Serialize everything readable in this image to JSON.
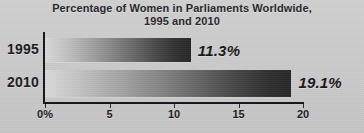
{
  "chart_data": {
    "type": "bar",
    "orientation": "horizontal",
    "title": "Percentage of Women in Parliaments Worldwide, 1995 and 2010",
    "title_lines": [
      "Percentage of Women in Parliaments Worldwide,",
      "1995 and 2010"
    ],
    "categories": [
      "1995",
      "2010"
    ],
    "values": [
      11.3,
      19.1
    ],
    "value_labels": [
      "11.3%",
      "19.1%"
    ],
    "xlabel": "",
    "ylabel": "",
    "xlim": [
      0,
      20
    ],
    "xticks": [
      0,
      5,
      10,
      15,
      20
    ],
    "xtick_labels": [
      "0%",
      "5",
      "10",
      "15",
      "20"
    ],
    "grid": false,
    "legend": "none",
    "series": [
      {
        "name": "Percentage of women in parliaments",
        "points": [
          {
            "category": "1995",
            "value": 11.3,
            "label": "11.3%"
          },
          {
            "category": "2010",
            "value": 19.1,
            "label": "19.1%"
          }
        ]
      }
    ]
  },
  "colors": {
    "background": "#cccccc",
    "title_text": "#26262a",
    "axis": "#15151a",
    "label_text": "#1b1b1f",
    "value_text": "#171717",
    "bar_gradient_start": "#d8d8d8",
    "bar_gradient_end": "#272727"
  }
}
